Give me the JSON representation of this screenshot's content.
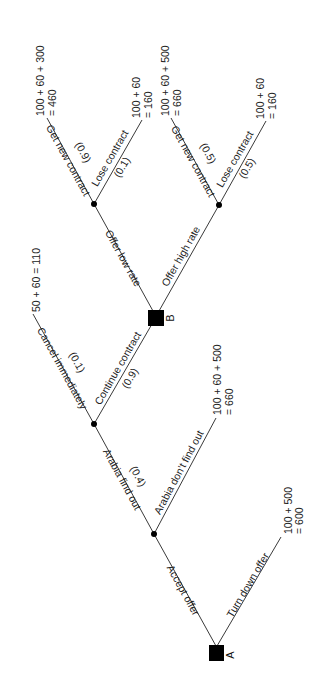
{
  "diagram": {
    "type": "decision-tree",
    "orientation": "rotated-90-ccw",
    "nodes": {
      "A": {
        "label": "A",
        "kind": "decision"
      },
      "B": {
        "label": "B",
        "kind": "decision"
      },
      "C1": {
        "kind": "chance"
      },
      "C2": {
        "kind": "chance"
      },
      "C3": {
        "kind": "chance"
      },
      "C4": {
        "kind": "chance"
      }
    },
    "edges": {
      "accept_offer": {
        "label": "Accept offer"
      },
      "turn_down_offer": {
        "label": "Turn down offer"
      },
      "arabia_find_out": {
        "label": "Arabia find out",
        "prob": "(0.4)"
      },
      "arabia_dont_find_out": {
        "label": "Arabia don’t find out"
      },
      "cancel_immediately": {
        "label": "Cancel immediately",
        "prob": "(0.1)"
      },
      "continue_contract": {
        "label": "Continue contract",
        "prob": "(0.9)"
      },
      "offer_low_rate": {
        "label": "Offer low rate"
      },
      "offer_high_rate": {
        "label": "Offer high rate"
      },
      "low_get_new_contract": {
        "label": "Get new contract",
        "prob": "(0.9)"
      },
      "low_lose_contract": {
        "label": "Lose contract",
        "prob": "(0.1)"
      },
      "high_get_new_contract": {
        "label": "Get new contract",
        "prob": "(0.5)"
      },
      "high_lose_contract": {
        "label": "Lose contract",
        "prob": "(0.5)"
      }
    },
    "payoffs": {
      "turn_down": {
        "line1": "100 + 500",
        "line2": "= 600"
      },
      "dont_find_out": {
        "line1": "100 + 60 + 500",
        "line2": "= 660"
      },
      "cancel": {
        "line1": "50 + 60 = 110"
      },
      "low_get": {
        "line1": "100 + 60 + 300",
        "line2": "= 460"
      },
      "low_lose": {
        "line1": "100 + 60",
        "line2": "= 160"
      },
      "high_get": {
        "line1": "100 + 60 + 500",
        "line2": "= 660"
      },
      "high_lose": {
        "line1": "100 + 60",
        "line2": "= 160"
      }
    }
  }
}
